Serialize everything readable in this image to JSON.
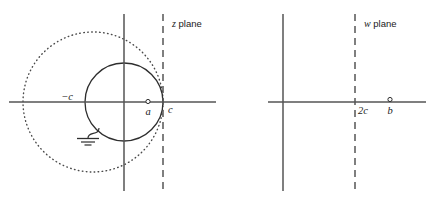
{
  "figure": {
    "background_color": "#ffffff",
    "line_color": "#3f3f3f",
    "text_color": "#1a1a1a",
    "width": 428,
    "height": 203
  },
  "panels": [
    {
      "id": "z-plane",
      "label_italic": "z",
      "label_rest": " plane",
      "label_x": 172,
      "label_y": 27,
      "axes": {
        "horizontal": {
          "x1": 9,
          "y1": 102,
          "x2": 216,
          "y2": 102
        },
        "vertical": {
          "x1": 124,
          "y1": 14,
          "x2": 124,
          "y2": 191
        }
      },
      "dashed_line": {
        "x": 163,
        "y1": 14,
        "y2": 191,
        "dash": "7,5"
      },
      "solid_circle": {
        "cx": 124,
        "cy": 102,
        "r": 39
      },
      "dotted_circle": {
        "cx": 93,
        "cy": 102,
        "r": 70
      },
      "points": [
        {
          "name": "minus-c",
          "label": "−c",
          "x": 86,
          "y": 102,
          "label_x": 74,
          "label_y": 100,
          "marker": "none"
        },
        {
          "name": "a",
          "label": "a",
          "x": 148,
          "y": 102,
          "label_x": 145,
          "label_y": 115,
          "marker": "open-circle"
        },
        {
          "name": "c",
          "label": "c",
          "x": 163,
          "y": 102,
          "label_x": 168,
          "label_y": 113,
          "marker": "none"
        }
      ],
      "ground_symbol": {
        "wire": "M 97,130 C 97,136 88,132 88,138",
        "bars": [
          {
            "x1": 77,
            "y1": 139,
            "x2": 99,
            "y2": 139
          },
          {
            "x1": 81,
            "y1": 142,
            "x2": 95,
            "y2": 142
          },
          {
            "x1": 85,
            "y1": 145,
            "x2": 91,
            "y2": 145
          }
        ]
      }
    },
    {
      "id": "w-plane",
      "label_italic": "w",
      "label_rest": " plane",
      "label_x": 364,
      "label_y": 27,
      "axes": {
        "horizontal": {
          "x1": 268,
          "y1": 102,
          "x2": 426,
          "y2": 102
        },
        "vertical": {
          "x1": 283,
          "y1": 14,
          "x2": 283,
          "y2": 191
        }
      },
      "dashed_line": {
        "x": 355,
        "y1": 14,
        "y2": 191,
        "dash": "7,5"
      },
      "points": [
        {
          "name": "two-c",
          "label": "2c",
          "x": 355,
          "y": 102,
          "label_x": 358,
          "label_y": 114,
          "marker": "none"
        },
        {
          "name": "b",
          "label": "b",
          "x": 390,
          "y": 100,
          "label_x": 387,
          "label_y": 114,
          "marker": "open-circle"
        }
      ]
    }
  ],
  "labels": {
    "z_plane": "z plane",
    "w_plane": "w plane",
    "minus_c": "−c",
    "a": "a",
    "c": "c",
    "two_c": "2c",
    "b": "b"
  }
}
